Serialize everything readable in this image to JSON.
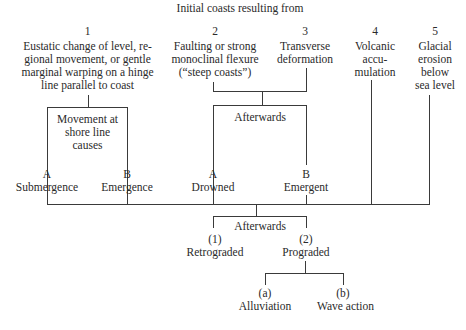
{
  "title": "Initial coasts resulting from",
  "causes": [
    {
      "num": "1",
      "lines": [
        "Eustatic change of level, re-",
        "gional movement, or gentle",
        "marginal warping on a hinge",
        "line parallel to coast"
      ]
    },
    {
      "num": "2",
      "lines": [
        "Faulting or strong",
        "monoclinal flexure",
        "(“steep coasts”)"
      ]
    },
    {
      "num": "3",
      "lines": [
        "Transverse",
        "deformation"
      ]
    },
    {
      "num": "4",
      "lines": [
        "Volcanic",
        "accu-",
        "mulation"
      ]
    },
    {
      "num": "5",
      "lines": [
        "Glacial",
        "erosion",
        "below",
        "sea level"
      ]
    }
  ],
  "movement_box": {
    "lines": [
      "Movement at",
      "shore line",
      "causes"
    ]
  },
  "afterwards_1": "Afterwards",
  "branch_a1": {
    "letter": "A",
    "label": "Submergence"
  },
  "branch_b1": {
    "letter": "B",
    "label": "Emergence"
  },
  "branch_a2": {
    "letter": "A",
    "label": "Drowned"
  },
  "branch_b2": {
    "letter": "B",
    "label": "Emergent"
  },
  "afterwards_2": "Afterwards",
  "outcome_1": {
    "num": "(1)",
    "label": "Retrograded"
  },
  "outcome_2": {
    "num": "(2)",
    "label": "Prograded"
  },
  "sub_a": {
    "num": "(a)",
    "label": "Alluviation"
  },
  "sub_b": {
    "num": "(b)",
    "label": "Wave action"
  }
}
